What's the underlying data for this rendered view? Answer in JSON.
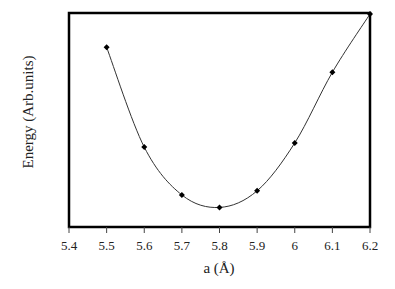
{
  "chart_data": {
    "type": "line",
    "title": "",
    "xlabel": "a (Å)",
    "ylabel": "Energy (Arb.units)",
    "xlim": [
      5.4,
      6.2
    ],
    "x_ticks": [
      "5.4",
      "5.5",
      "5.6",
      "5.7",
      "5.8",
      "5.9",
      "6",
      "6.1",
      "6.2"
    ],
    "y_ticks": [],
    "grid": false,
    "legend": null,
    "series": [
      {
        "name": "Energy",
        "marker": "diamond",
        "color": "#000000",
        "x": [
          5.5,
          5.6,
          5.7,
          5.8,
          5.9,
          6.0,
          6.1,
          6.2
        ],
        "y_relative": [
          0.84,
          0.36,
          0.13,
          0.07,
          0.15,
          0.38,
          0.72,
          1.0
        ]
      }
    ]
  },
  "labels": {
    "xlabel": "a (Å)",
    "ylabel": "Energy (Arb.units)",
    "ticks": [
      "5.4",
      "5.5",
      "5.6",
      "5.7",
      "5.8",
      "5.9",
      "6",
      "6.1",
      "6.2"
    ]
  }
}
